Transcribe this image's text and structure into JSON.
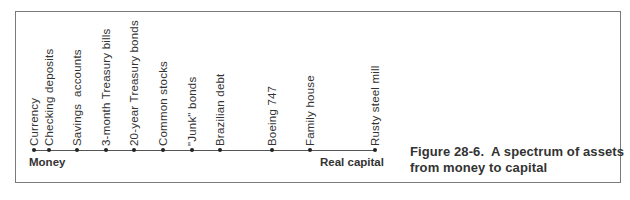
{
  "figure": {
    "caption_line1": "Figure 28-6.  A spectrum of assets",
    "caption_line2": "from money to capital"
  },
  "spectrum": {
    "left_end_label": "Money",
    "right_end_label": "Real capital",
    "assets": [
      {
        "label": "Currency",
        "x": 34
      },
      {
        "label": "Checking deposits",
        "x": 49
      },
      {
        "label": "Savings  accounts",
        "x": 77
      },
      {
        "label": "3-month Treasury bills",
        "x": 106
      },
      {
        "label": "20-year Treasury bonds",
        "x": 134
      },
      {
        "label": "Common stocks",
        "x": 163
      },
      {
        "label": "\"Junk\" bonds",
        "x": 192
      },
      {
        "label": "Brazilian debt",
        "x": 220
      },
      {
        "label": "Boeing 747",
        "x": 272
      },
      {
        "label": "Family house",
        "x": 310
      },
      {
        "label": "Rusty steel mill",
        "x": 375
      }
    ]
  }
}
